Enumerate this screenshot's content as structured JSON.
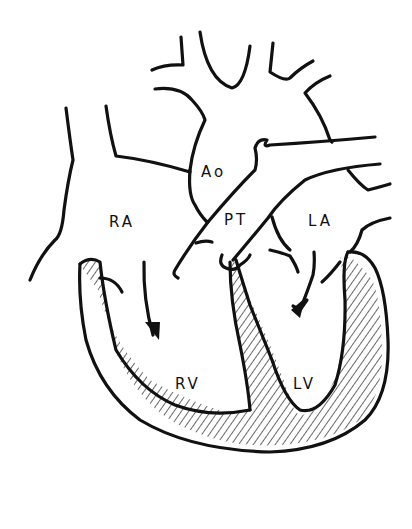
{
  "diagram": {
    "type": "anatomical line drawing",
    "labels": {
      "ao": "Ao",
      "pt": "PT",
      "ra": "RA",
      "la": "LA",
      "rv": "RV",
      "lv": "LV"
    },
    "colors": {
      "ink": "#111111",
      "background": "#ffffff"
    }
  }
}
